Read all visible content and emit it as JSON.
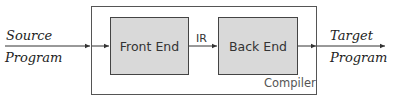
{
  "diagram": {
    "input": {
      "line1": "Source",
      "line2": "Program"
    },
    "output": {
      "line1": "Target",
      "line2": "Program"
    },
    "container": {
      "label": "Compiler"
    },
    "stages": [
      {
        "label": "Front End"
      },
      {
        "label": "Back End"
      }
    ],
    "edges": [
      {
        "from": "Source Program",
        "to": "Front End",
        "label": ""
      },
      {
        "from": "Front End",
        "to": "Back End",
        "label": "IR"
      },
      {
        "from": "Back End",
        "to": "Target Program",
        "label": ""
      }
    ],
    "colors": {
      "stage_fill": "#d9d9d9",
      "stroke": "#444444",
      "background": "#ffffff"
    }
  }
}
